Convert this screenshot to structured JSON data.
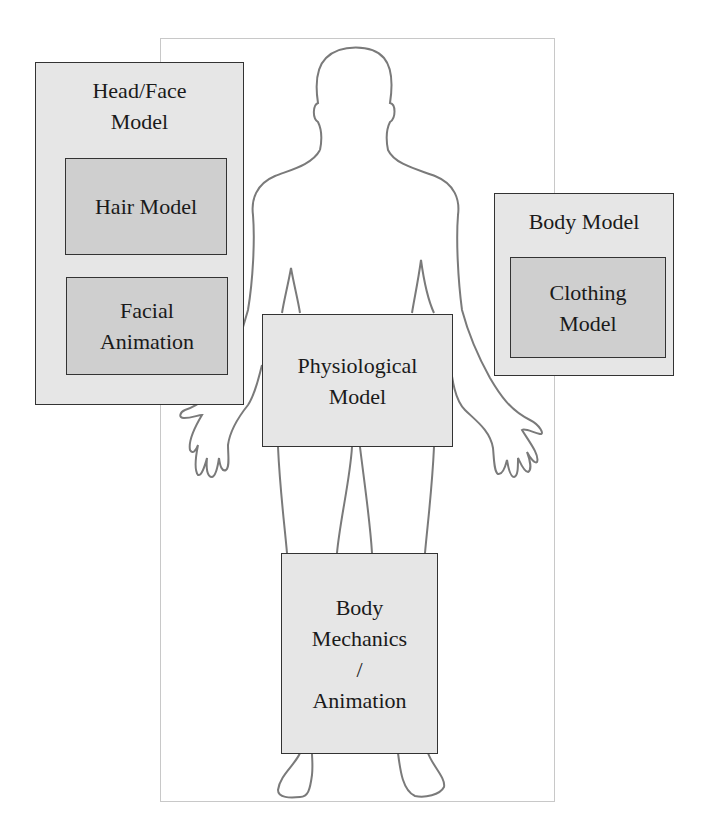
{
  "diagram": {
    "type": "human-body-model-components",
    "background_figure": "human-silhouette-outline",
    "boxes": {
      "head_face": {
        "label": "Head/Face Model"
      },
      "hair": {
        "label": "Hair Model"
      },
      "facial_animation": {
        "label_line1": "Facial",
        "label_line2": "Animation"
      },
      "body_model": {
        "label": "Body Model"
      },
      "clothing": {
        "label_line1": "Clothing",
        "label_line2": "Model"
      },
      "physiological": {
        "label_line1": "Physiological",
        "label_line2": "Model"
      },
      "body_mechanics": {
        "label_line1": "Body",
        "label_line2": "Mechanics",
        "label_line3": "/",
        "label_line4": "Animation"
      }
    },
    "colors": {
      "outer_box": "#e6e6e6",
      "inner_box": "#cfcfcf",
      "border": "#333333",
      "outline": "#777777"
    }
  }
}
